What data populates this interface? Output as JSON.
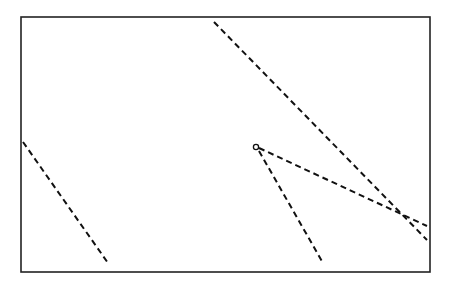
{
  "canvas": {
    "width": 450,
    "height": 285,
    "background": "#ffffff"
  },
  "frame": {
    "x": 21,
    "y": 17,
    "width": 409,
    "height": 255,
    "stroke": "#222222",
    "stroke_width": 1.6
  },
  "style": {
    "line_color": "#111111",
    "line_width": 2.0,
    "dash": "6 4"
  },
  "marker": {
    "shape": "circle",
    "cx": 256,
    "cy": 147,
    "r": 2.6
  },
  "lines": [
    {
      "id": "left-line",
      "x1": 23,
      "y1": 142,
      "x2": 108,
      "y2": 263
    },
    {
      "id": "long-diagonal-line",
      "x1": 214,
      "y1": 22,
      "x2": 427,
      "y2": 240
    },
    {
      "id": "ray-to-right",
      "x1": 259,
      "y1": 148,
      "x2": 427,
      "y2": 226
    },
    {
      "id": "ray-to-bottom",
      "x1": 259,
      "y1": 151,
      "x2": 323,
      "y2": 263
    }
  ]
}
